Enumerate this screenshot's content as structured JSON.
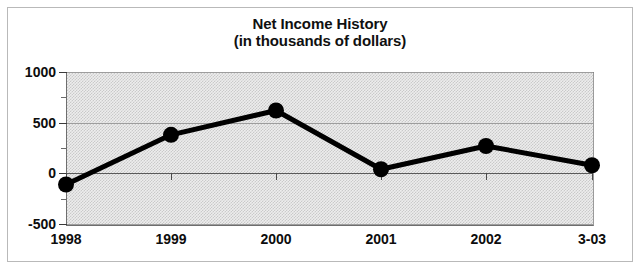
{
  "chart_data": {
    "type": "line",
    "title": "Net Income History",
    "subtitle": "(in thousands of dollars)",
    "xlabel": "",
    "ylabel": "",
    "categories": [
      "1998",
      "1999",
      "2000",
      "2001",
      "2002",
      "3-03"
    ],
    "values": [
      -110,
      380,
      620,
      40,
      270,
      80
    ],
    "series": [
      {
        "name": "Net Income",
        "values": [
          -110,
          380,
          620,
          40,
          270,
          80
        ]
      }
    ],
    "ylim": [
      -500,
      1000
    ],
    "ytick_labels": [
      "1000",
      "500",
      "0",
      "-500"
    ],
    "ytick_values": [
      1000,
      500,
      0,
      -500
    ],
    "yminor_tick_values": [
      750,
      250,
      -250
    ],
    "grid": true,
    "legend": "none",
    "marker": "filled-circle",
    "line_color": "#000000",
    "marker_color": "#000000",
    "plot_background": "#ededed",
    "gridline_color": "#9d9d9d",
    "zero_line_color": "#5a5a5a"
  },
  "chart": {
    "title_lines": [
      "Net Income History",
      "(in thousands of dollars)"
    ]
  }
}
